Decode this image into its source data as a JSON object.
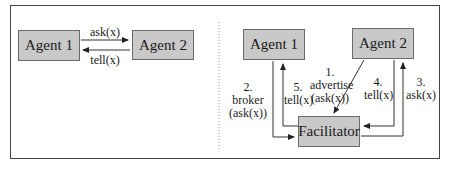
{
  "left_panel": {
    "agent1": "Agent 1",
    "agent2": "Agent 2",
    "ask_label": "ask(x)",
    "tell_label": "tell(x)"
  },
  "right_panel": {
    "agent1": "Agent 1",
    "agent2": "Agent 2",
    "facilitator": "Facilitator",
    "step1": {
      "num": "1.",
      "line1": "advertise",
      "line2": "(ask(x))"
    },
    "step2": {
      "num": "2.",
      "line1": "broker",
      "line2": "(ask(x))"
    },
    "step3": {
      "num": "3.",
      "line1": "ask(x)"
    },
    "step4": {
      "num": "4.",
      "line1": "tell(x)"
    },
    "step5": {
      "num": "5.",
      "line1": "tell(x)"
    }
  },
  "colors": {
    "box_fill": "#c9c9c9",
    "box_border": "#6a6a6a",
    "line": "#333333"
  }
}
